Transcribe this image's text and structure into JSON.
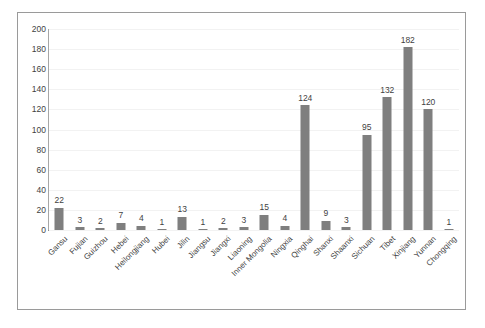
{
  "chart_data": {
    "type": "bar",
    "title": "",
    "subtitle": "",
    "xlabel": "",
    "ylabel": "",
    "ylim": [
      0,
      200
    ],
    "ytick_step": 20,
    "yticks": [
      0,
      20,
      40,
      60,
      80,
      100,
      120,
      140,
      160,
      180,
      200
    ],
    "grid": true,
    "legend": false,
    "legend_position": "none",
    "data_labels": true,
    "bar_color": "#7f7f7f",
    "categories": [
      "Gansu",
      "Fujian",
      "Guizhou",
      "Hebei",
      "Heilongjiang",
      "Hubei",
      "Jilin",
      "Jiangsu",
      "Jiangxi",
      "Liaoning",
      "Inner Mongolia",
      "Ningxia",
      "Qinghai",
      "Shanxi",
      "Shaanxi",
      "Sichuan",
      "Tibet",
      "Xinjiang",
      "Yunnan",
      "Chongqing"
    ],
    "values": [
      22,
      3,
      2,
      7,
      4,
      1,
      13,
      1,
      2,
      3,
      15,
      4,
      124,
      9,
      3,
      95,
      132,
      182,
      120,
      1
    ]
  },
  "colors": {
    "bar": "#7f7f7f",
    "gridline": "#f2f2f2",
    "axis": "#a6a6a6",
    "frame_border": "#9a9a9a",
    "text": "#3f3f3f",
    "background": "#ffffff"
  }
}
